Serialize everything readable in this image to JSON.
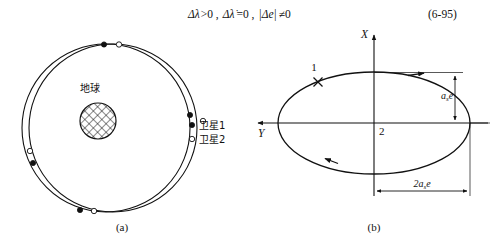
{
  "equation": {
    "line": "Δλ>0 , Δλ̇ =0 , |Δe| ≠0",
    "parts": {
      "p1": "Δλ",
      "rel1": ">0 ,",
      "p2": "Δλ̇",
      "rel2": "=0 ,",
      "p3": "|Δe|",
      "rel3": "≠0"
    },
    "number": "(6-95)"
  },
  "panel_a": {
    "caption": "(a)",
    "earth_label": "地球",
    "legend": [
      {
        "marker": "filled-dot",
        "label": "卫星1"
      },
      {
        "marker": "hollow-dot",
        "label": "卫星2"
      }
    ],
    "orbits": [
      {
        "name": "orbit-satellite-1",
        "cx": 113,
        "cy": 128,
        "r": 84
      },
      {
        "name": "orbit-satellite-2",
        "cx": 106,
        "cy": 128,
        "r": 84
      }
    ],
    "satellite_1_points": [
      {
        "x": 104,
        "y": 44
      },
      {
        "x": 190,
        "y": 115
      },
      {
        "x": 80,
        "y": 210
      },
      {
        "x": 33,
        "y": 163
      }
    ],
    "satellite_2_points": [
      {
        "x": 119,
        "y": 44
      },
      {
        "x": 203,
        "y": 121
      },
      {
        "x": 94,
        "y": 211
      },
      {
        "x": 30,
        "y": 151
      }
    ]
  },
  "panel_b": {
    "caption": "(b)",
    "axis_x_label": "X",
    "axis_y_label": "Y",
    "point_1_label": "1",
    "point_2_label": "2",
    "dim_vertical_label": "a",
    "dim_vertical_sub": "s",
    "dim_vertical_tail": "e",
    "dim_horizontal_label": "2a",
    "dim_horizontal_sub": "s",
    "dim_horizontal_tail": "e",
    "ellipse": {
      "cx": 374,
      "cy": 123,
      "rx": 96,
      "ry": 51
    },
    "marker_1": {
      "x": 318,
      "y": 82,
      "type": "x-cross"
    },
    "direction_arrows": [
      {
        "x": 424,
        "y": 72,
        "dir": "right"
      },
      {
        "x": 325,
        "y": 166,
        "dir": "down-left"
      }
    ]
  },
  "colors": {
    "ink": "#111111",
    "background": "#ffffff"
  }
}
